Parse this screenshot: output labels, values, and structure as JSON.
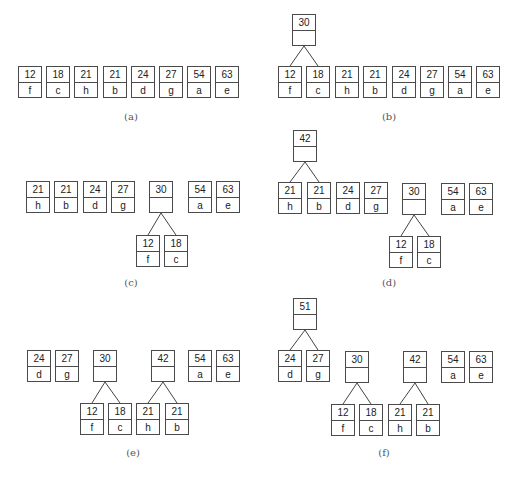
{
  "figure": {
    "node_style": {
      "border_color": "#4a4a4a",
      "text_color": "#222222",
      "edge_color": "#444444"
    },
    "panels": [
      {
        "id": "a",
        "caption": "(a)",
        "caption_pos": [
          131,
          118
        ],
        "nodes": [
          {
            "id": "a-f",
            "weight": "12",
            "symbol": "f",
            "x": 18,
            "y": 66
          },
          {
            "id": "a-c",
            "weight": "18",
            "symbol": "c",
            "x": 46,
            "y": 66
          },
          {
            "id": "a-h",
            "weight": "21",
            "symbol": "h",
            "x": 74,
            "y": 66
          },
          {
            "id": "a-b",
            "weight": "21",
            "symbol": "b",
            "x": 103,
            "y": 66
          },
          {
            "id": "a-d",
            "weight": "24",
            "symbol": "d",
            "x": 131,
            "y": 66
          },
          {
            "id": "a-g",
            "weight": "27",
            "symbol": "g",
            "x": 159,
            "y": 66
          },
          {
            "id": "a-a",
            "weight": "54",
            "symbol": "a",
            "x": 187,
            "y": 66
          },
          {
            "id": "a-e",
            "weight": "63",
            "symbol": "e",
            "x": 215,
            "y": 66
          }
        ],
        "edges": []
      },
      {
        "id": "b",
        "caption": "(b)",
        "caption_pos": [
          389,
          118
        ],
        "nodes": [
          {
            "id": "b-30",
            "weight": "30",
            "symbol": "",
            "x": 292,
            "y": 14
          },
          {
            "id": "b-f",
            "weight": "12",
            "symbol": "f",
            "x": 278,
            "y": 66
          },
          {
            "id": "b-c",
            "weight": "18",
            "symbol": "c",
            "x": 306,
            "y": 66
          },
          {
            "id": "b-h",
            "weight": "21",
            "symbol": "h",
            "x": 335,
            "y": 66
          },
          {
            "id": "b-b",
            "weight": "21",
            "symbol": "b",
            "x": 363,
            "y": 66
          },
          {
            "id": "b-d",
            "weight": "24",
            "symbol": "d",
            "x": 392,
            "y": 66
          },
          {
            "id": "b-g",
            "weight": "27",
            "symbol": "g",
            "x": 420,
            "y": 66
          },
          {
            "id": "b-a",
            "weight": "54",
            "symbol": "a",
            "x": 448,
            "y": 66
          },
          {
            "id": "b-e",
            "weight": "63",
            "symbol": "e",
            "x": 476,
            "y": 66
          }
        ],
        "edges": [
          [
            "b-30",
            "b-f"
          ],
          [
            "b-30",
            "b-c"
          ]
        ]
      },
      {
        "id": "c",
        "caption": "(c)",
        "caption_pos": [
          131,
          284
        ],
        "nodes": [
          {
            "id": "c-h",
            "weight": "21",
            "symbol": "h",
            "x": 26,
            "y": 181
          },
          {
            "id": "c-b",
            "weight": "21",
            "symbol": "b",
            "x": 54,
            "y": 181
          },
          {
            "id": "c-d",
            "weight": "24",
            "symbol": "d",
            "x": 83,
            "y": 181
          },
          {
            "id": "c-g",
            "weight": "27",
            "symbol": "g",
            "x": 111,
            "y": 181
          },
          {
            "id": "c-30",
            "weight": "30",
            "symbol": "",
            "x": 149,
            "y": 181
          },
          {
            "id": "c-a",
            "weight": "54",
            "symbol": "a",
            "x": 188,
            "y": 181
          },
          {
            "id": "c-e",
            "weight": "63",
            "symbol": "e",
            "x": 216,
            "y": 181
          },
          {
            "id": "c-f",
            "weight": "12",
            "symbol": "f",
            "x": 136,
            "y": 235
          },
          {
            "id": "c-c",
            "weight": "18",
            "symbol": "c",
            "x": 164,
            "y": 235
          }
        ],
        "edges": [
          [
            "c-30",
            "c-f"
          ],
          [
            "c-30",
            "c-c"
          ]
        ]
      },
      {
        "id": "d",
        "caption": "(d)",
        "caption_pos": [
          389,
          284
        ],
        "nodes": [
          {
            "id": "d-42",
            "weight": "42",
            "symbol": "",
            "x": 293,
            "y": 130
          },
          {
            "id": "d-h",
            "weight": "21",
            "symbol": "h",
            "x": 278,
            "y": 182
          },
          {
            "id": "d-b",
            "weight": "21",
            "symbol": "b",
            "x": 307,
            "y": 182
          },
          {
            "id": "d-d",
            "weight": "24",
            "symbol": "d",
            "x": 336,
            "y": 182
          },
          {
            "id": "d-g",
            "weight": "27",
            "symbol": "g",
            "x": 364,
            "y": 182
          },
          {
            "id": "d-30",
            "weight": "30",
            "symbol": "",
            "x": 402,
            "y": 183
          },
          {
            "id": "d-a",
            "weight": "54",
            "symbol": "a",
            "x": 441,
            "y": 183
          },
          {
            "id": "d-e",
            "weight": "63",
            "symbol": "e",
            "x": 469,
            "y": 183
          },
          {
            "id": "d-f",
            "weight": "12",
            "symbol": "f",
            "x": 389,
            "y": 236
          },
          {
            "id": "d-c",
            "weight": "18",
            "symbol": "c",
            "x": 417,
            "y": 236
          }
        ],
        "edges": [
          [
            "d-42",
            "d-h"
          ],
          [
            "d-42",
            "d-b"
          ],
          [
            "d-30",
            "d-f"
          ],
          [
            "d-30",
            "d-c"
          ]
        ]
      },
      {
        "id": "e",
        "caption": "(e)",
        "caption_pos": [
          133,
          454
        ],
        "nodes": [
          {
            "id": "e-d",
            "weight": "24",
            "symbol": "d",
            "x": 27,
            "y": 350
          },
          {
            "id": "e-g",
            "weight": "27",
            "symbol": "g",
            "x": 55,
            "y": 350
          },
          {
            "id": "e-30",
            "weight": "30",
            "symbol": "",
            "x": 93,
            "y": 350
          },
          {
            "id": "e-42",
            "weight": "42",
            "symbol": "",
            "x": 151,
            "y": 350
          },
          {
            "id": "e-a",
            "weight": "54",
            "symbol": "a",
            "x": 188,
            "y": 350
          },
          {
            "id": "e-e",
            "weight": "63",
            "symbol": "e",
            "x": 216,
            "y": 350
          },
          {
            "id": "e-f",
            "weight": "12",
            "symbol": "f",
            "x": 80,
            "y": 403
          },
          {
            "id": "e-c",
            "weight": "18",
            "symbol": "c",
            "x": 108,
            "y": 403
          },
          {
            "id": "e-h",
            "weight": "21",
            "symbol": "h",
            "x": 136,
            "y": 403
          },
          {
            "id": "e-b",
            "weight": "21",
            "symbol": "b",
            "x": 165,
            "y": 403
          }
        ],
        "edges": [
          [
            "e-30",
            "e-f"
          ],
          [
            "e-30",
            "e-c"
          ],
          [
            "e-42",
            "e-h"
          ],
          [
            "e-42",
            "e-b"
          ]
        ]
      },
      {
        "id": "f",
        "caption": "(f)",
        "caption_pos": [
          384,
          454
        ],
        "nodes": [
          {
            "id": "f-51",
            "weight": "51",
            "symbol": "",
            "x": 293,
            "y": 298
          },
          {
            "id": "f-d",
            "weight": "24",
            "symbol": "d",
            "x": 278,
            "y": 350
          },
          {
            "id": "f-g",
            "weight": "27",
            "symbol": "g",
            "x": 306,
            "y": 350
          },
          {
            "id": "f-30",
            "weight": "30",
            "symbol": "",
            "x": 345,
            "y": 351
          },
          {
            "id": "f-42",
            "weight": "42",
            "symbol": "",
            "x": 403,
            "y": 351
          },
          {
            "id": "f-a",
            "weight": "54",
            "symbol": "a",
            "x": 441,
            "y": 351
          },
          {
            "id": "f-e",
            "weight": "63",
            "symbol": "e",
            "x": 469,
            "y": 351
          },
          {
            "id": "f-f",
            "weight": "12",
            "symbol": "f",
            "x": 331,
            "y": 404
          },
          {
            "id": "f-c",
            "weight": "18",
            "symbol": "c",
            "x": 359,
            "y": 404
          },
          {
            "id": "f-h",
            "weight": "21",
            "symbol": "h",
            "x": 388,
            "y": 404
          },
          {
            "id": "f-b",
            "weight": "21",
            "symbol": "b",
            "x": 416,
            "y": 404
          }
        ],
        "edges": [
          [
            "f-51",
            "f-d"
          ],
          [
            "f-51",
            "f-g"
          ],
          [
            "f-30",
            "f-f"
          ],
          [
            "f-30",
            "f-c"
          ],
          [
            "f-42",
            "f-h"
          ],
          [
            "f-42",
            "f-b"
          ]
        ]
      }
    ]
  }
}
